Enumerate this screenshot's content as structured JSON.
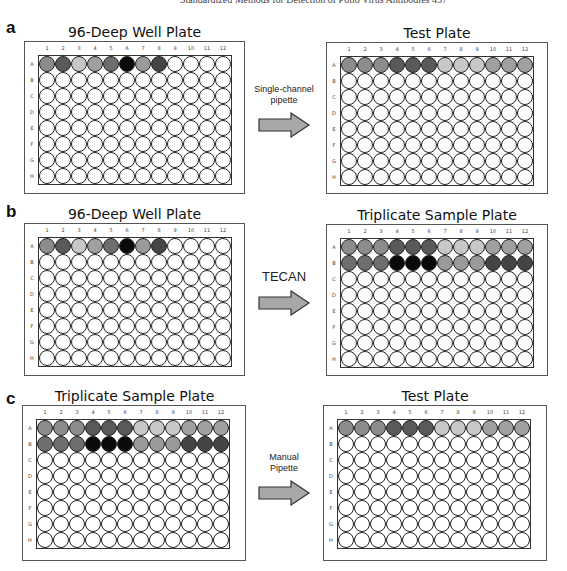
{
  "header": {
    "text": "Standardized Methods for Detection of Polio Virus Antibodies    457"
  },
  "colors": {
    "empty": "#ffffff",
    "s1": "#8c8c8c",
    "s2": "#5a5a5a",
    "s3": "#c8c8c8",
    "s4": "#a0a0a0",
    "s5": "#6e6e6e",
    "s6": "#0a0a0a",
    "s7": "#9a9a9a",
    "s8": "#454545",
    "arrow_fill": "#a8a8a8",
    "arrow_stroke": "#333333"
  },
  "column_labels": [
    "1",
    "2",
    "3",
    "4",
    "5",
    "6",
    "7",
    "8",
    "9",
    "10",
    "11",
    "12"
  ],
  "row_labels": [
    "A",
    "B",
    "C",
    "D",
    "E",
    "F",
    "G",
    "H"
  ],
  "panels": [
    {
      "letter": "a",
      "source": {
        "title": "96-Deep Well Plate",
        "filled_rows": {
          "A": [
            "s1",
            "s2",
            "s3",
            "s4",
            "s5",
            "s6",
            "s7",
            "s8",
            "empty",
            "empty",
            "empty",
            "empty"
          ]
        }
      },
      "transfer": {
        "label": "Single-channel\npipette"
      },
      "target": {
        "title": "Test Plate",
        "filled_rows": {
          "A": [
            "s1",
            "s1",
            "s1",
            "s2",
            "s2",
            "s2",
            "s3",
            "s3",
            "s3",
            "s4",
            "s4",
            "s4"
          ]
        }
      }
    },
    {
      "letter": "b",
      "source": {
        "title": "96-Deep Well Plate",
        "filled_rows": {
          "A": [
            "s1",
            "s2",
            "s3",
            "s4",
            "s5",
            "s6",
            "s7",
            "s8",
            "empty",
            "empty",
            "empty",
            "empty"
          ]
        }
      },
      "transfer": {
        "label": "TECAN"
      },
      "target": {
        "title": "Triplicate Sample Plate",
        "filled_rows": {
          "A": [
            "s1",
            "s1",
            "s1",
            "s2",
            "s2",
            "s2",
            "s3",
            "s3",
            "s3",
            "s4",
            "s4",
            "s4"
          ],
          "B": [
            "s5",
            "s5",
            "s5",
            "s6",
            "s6",
            "s6",
            "s7",
            "s7",
            "s7",
            "s8",
            "s8",
            "s8"
          ]
        }
      }
    },
    {
      "letter": "c",
      "source": {
        "title": "Triplicate Sample Plate",
        "filled_rows": {
          "A": [
            "s1",
            "s1",
            "s1",
            "s2",
            "s2",
            "s2",
            "s3",
            "s3",
            "s3",
            "s4",
            "s4",
            "s4"
          ],
          "B": [
            "s5",
            "s5",
            "s5",
            "s6",
            "s6",
            "s6",
            "s7",
            "s7",
            "s7",
            "s8",
            "s8",
            "s8"
          ]
        }
      },
      "transfer": {
        "label": "Manual\nPipette"
      },
      "target": {
        "title": "Test Plate",
        "filled_rows": {
          "A": [
            "s1",
            "s1",
            "s1",
            "s2",
            "s2",
            "s2",
            "s3",
            "s3",
            "s3",
            "s4",
            "s4",
            "s4"
          ]
        }
      }
    }
  ]
}
